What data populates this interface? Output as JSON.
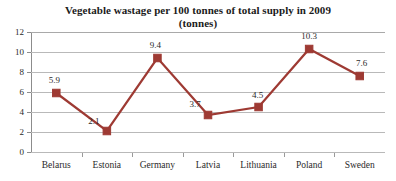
{
  "chart_data": {
    "type": "line",
    "title": "Vegetable wastage per 100 tonnes of total supply in 2009",
    "subtitle": "(tonnes)",
    "xlabel": "",
    "ylabel": "",
    "categories": [
      "Belarus",
      "Estonia",
      "Germany",
      "Latvia",
      "Lithuania",
      "Poland",
      "Sweden"
    ],
    "values": [
      5.9,
      2.1,
      9.4,
      3.7,
      4.5,
      10.3,
      7.6
    ],
    "data_labels": [
      "5.9",
      "2.1",
      "9.4",
      "3.7",
      "4.5",
      "10.3",
      "7.6"
    ],
    "ylim": [
      0,
      12
    ],
    "yticks": [
      0,
      2,
      4,
      6,
      8,
      10,
      12
    ],
    "ytick_labels": [
      "0",
      "2",
      "4",
      "6",
      "8",
      "10",
      "12"
    ],
    "grid": "horizontal",
    "legend": "none",
    "series_color": "#9E3A33",
    "marker": "square",
    "gridline_color": "#B9B9B9",
    "axis_color": "#8C8C8C"
  }
}
